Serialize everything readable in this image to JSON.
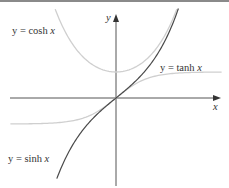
{
  "chart_data": {
    "type": "line",
    "title": "",
    "xlabel": "x",
    "ylabel": "y",
    "grid": false,
    "legend": "inline labels",
    "xlim": [
      -3.3,
      3.3
    ],
    "ylim": [
      -3.4,
      3.3
    ],
    "origin_px": [
      116,
      98
    ],
    "scale_px": [
      32,
      26
    ],
    "series": [
      {
        "name": "y = cosh x",
        "function": "cosh",
        "color": "#c8c8c8",
        "x_range": [
          -1.9,
          1.9
        ],
        "x": [
          -1.9,
          -1.5,
          -1,
          -0.5,
          0,
          0.5,
          1,
          1.5,
          1.9
        ],
        "y": [
          3.42,
          2.35,
          1.54,
          1.13,
          1.0,
          1.13,
          1.54,
          2.35,
          3.42
        ]
      },
      {
        "name": "y = tanh x",
        "function": "tanh",
        "color": "#c8c8c8",
        "x_range": [
          -3.3,
          3.3
        ],
        "x": [
          -3,
          -2,
          -1,
          -0.5,
          0,
          0.5,
          1,
          2,
          3
        ],
        "y": [
          -0.995,
          -0.964,
          -0.762,
          -0.462,
          0,
          0.462,
          0.762,
          0.964,
          0.995
        ]
      },
      {
        "name": "y = sinh x",
        "function": "sinh",
        "color": "#444444",
        "x_range": [
          -1.85,
          1.95
        ],
        "x": [
          -1.85,
          -1.5,
          -1,
          -0.5,
          0,
          0.5,
          1,
          1.5,
          1.95
        ],
        "y": [
          -3.1,
          -2.13,
          -1.18,
          -0.52,
          0,
          0.52,
          1.18,
          2.13,
          3.44
        ]
      }
    ],
    "annotations": [
      {
        "text_prefix": "y = cosh ",
        "var": "x"
      },
      {
        "text_prefix": "y = tanh ",
        "var": "x"
      },
      {
        "text_prefix": "y = sinh ",
        "var": "x"
      }
    ]
  },
  "labels": {
    "cosh_prefix": "y = cosh ",
    "tanh_prefix": "y = tanh ",
    "sinh_prefix": "y = sinh ",
    "var": "x",
    "x_axis": "x",
    "y_axis": "y"
  }
}
